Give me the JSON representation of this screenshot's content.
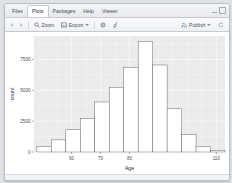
{
  "window": {
    "tabs": [
      {
        "label": "Files",
        "active": false
      },
      {
        "label": "Plots",
        "active": true
      },
      {
        "label": "Packages",
        "active": false
      },
      {
        "label": "Help",
        "active": false
      },
      {
        "label": "Viewer",
        "active": false
      }
    ],
    "controls": {
      "minimize": "minimize-icon",
      "maximize": "maximize-icon"
    }
  },
  "toolbar": {
    "back_label": "",
    "forward_label": "",
    "zoom_label": "Zoom",
    "export_label": "Export",
    "export_caret": "▾",
    "clear_label": "",
    "broom_label": "",
    "publish_label": "Publish",
    "publish_caret": "▾",
    "refresh_label": "",
    "icons": {
      "back": "arrow-left-icon",
      "forward": "arrow-right-icon",
      "zoom": "magnifier-icon",
      "export": "export-image-icon",
      "clear": "gear-icon",
      "broom": "broom-icon",
      "publish": "publish-icon",
      "refresh": "refresh-icon"
    }
  },
  "chart_data": {
    "type": "bar",
    "title": "",
    "subtitle": "",
    "xlabel": "Age",
    "ylabel": "count",
    "xlim": [
      47,
      113
    ],
    "ylim": [
      0,
      9400
    ],
    "xticks": [
      60,
      70,
      80,
      110
    ],
    "xtick_labels": [
      "60",
      "70",
      "80",
      "110"
    ],
    "yticks": [
      0,
      2500,
      5000,
      7500
    ],
    "ytick_labels": [
      "0",
      "2500",
      "5000",
      "7500"
    ],
    "grid": true,
    "legend": "none",
    "bin_width": 5,
    "bin_starts": [
      48,
      53,
      58,
      63,
      68,
      73,
      78,
      83,
      88,
      93,
      98,
      103,
      108
    ],
    "categories": [
      "48",
      "53",
      "58",
      "63",
      "68",
      "73",
      "78",
      "83",
      "88",
      "93",
      "98",
      "103",
      "108"
    ],
    "values": [
      430,
      980,
      1800,
      2700,
      4050,
      5250,
      6850,
      8950,
      7050,
      3500,
      1400,
      420,
      110
    ],
    "series": [
      {
        "name": "count",
        "values": [
          430,
          980,
          1800,
          2700,
          4050,
          5250,
          6850,
          8950,
          7050,
          3500,
          1400,
          420,
          110
        ]
      }
    ],
    "panel_background": "#EBEBEB",
    "bar_fill": "#FFFFFF",
    "bar_stroke": "#5A5A5A"
  },
  "colors": {
    "chrome": "#EEF0F2",
    "border": "#C6CBD1",
    "text": "#4A5058",
    "panel": "#EBEBEB"
  }
}
